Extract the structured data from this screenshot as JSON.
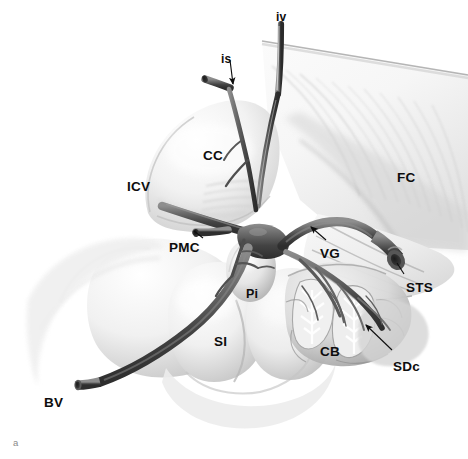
{
  "figure": {
    "panel_label": "a",
    "type": "anatomical-illustration",
    "style": "grayscale pencil/airbrush medical drawing",
    "background_color": "#ffffff",
    "ink_color": "#0d0d0d",
    "vessel_dark": "#4a4a4a",
    "vessel_mid": "#6e6e6e",
    "tissue_light": "#ededed",
    "tissue_shadow": "#b9b9b9"
  },
  "labels": [
    {
      "id": "iv",
      "text": "iv",
      "x": 276,
      "y": 11,
      "size": "lbl-sm",
      "leader": "none"
    },
    {
      "id": "is",
      "text": "is",
      "x": 221,
      "y": 53,
      "size": "lbl-sm",
      "leader": "arrow"
    },
    {
      "id": "CC",
      "text": "CC",
      "x": 203,
      "y": 149,
      "size": "lbl-lg",
      "leader": "none"
    },
    {
      "id": "ICV",
      "text": "ICV",
      "x": 127,
      "y": 180,
      "size": "lbl-lg",
      "leader": "none"
    },
    {
      "id": "PMC",
      "text": "PMC",
      "x": 169,
      "y": 241,
      "size": "lbl-lg",
      "leader": "line"
    },
    {
      "id": "FC",
      "text": "FC",
      "x": 397,
      "y": 171,
      "size": "lbl-lg",
      "leader": "none"
    },
    {
      "id": "VG",
      "text": "VG",
      "x": 320,
      "y": 247,
      "size": "lbl-lg",
      "leader": "arrow"
    },
    {
      "id": "STS",
      "text": "STS",
      "x": 406,
      "y": 281,
      "size": "lbl-lg",
      "leader": "line"
    },
    {
      "id": "Pi",
      "text": "Pi",
      "x": 246,
      "y": 288,
      "size": "lbl-md",
      "leader": "none"
    },
    {
      "id": "SI",
      "text": "SI",
      "x": 214,
      "y": 335,
      "size": "lbl-lg",
      "leader": "none"
    },
    {
      "id": "CB",
      "text": "CB",
      "x": 320,
      "y": 345,
      "size": "lbl-lg",
      "leader": "none"
    },
    {
      "id": "SDc",
      "text": "SDc",
      "x": 393,
      "y": 360,
      "size": "lbl-lg",
      "leader": "arrow"
    },
    {
      "id": "BV",
      "text": "BV",
      "x": 44,
      "y": 396,
      "size": "lbl-lg",
      "leader": "none"
    }
  ],
  "structures": [
    {
      "key": "iv",
      "name": "internal cerebral vein (cut)"
    },
    {
      "key": "is",
      "name": "inferior sagittal sinus (cut)"
    },
    {
      "key": "CC",
      "name": "corpus callosum splenium"
    },
    {
      "key": "ICV",
      "name": "internal cerebral vein"
    },
    {
      "key": "PMC",
      "name": "posterior mesencephalic / medial posterior choroidal vein"
    },
    {
      "key": "FC",
      "name": "falx cerebri"
    },
    {
      "key": "VG",
      "name": "vein of Galen"
    },
    {
      "key": "STS",
      "name": "straight sinus (cut)"
    },
    {
      "key": "Pi",
      "name": "pineal gland"
    },
    {
      "key": "SI",
      "name": "superior colliculus / quadrigeminal plate"
    },
    {
      "key": "CB",
      "name": "cerebellum (culmen, arbor vitae)"
    },
    {
      "key": "SDc",
      "name": "superior cerebellar (declival) vein"
    },
    {
      "key": "BV",
      "name": "basal vein of Rosenthal (cut)"
    }
  ]
}
